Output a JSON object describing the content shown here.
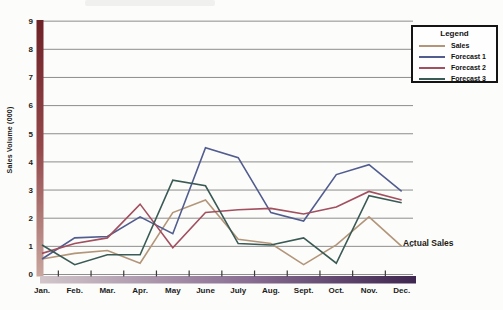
{
  "legend": {
    "title": "Legend"
  },
  "colors": {
    "gridline": "#8d8d8d",
    "tick": "#3a3a3a",
    "y_axis_bar_top": "#6e2226",
    "y_axis_bar_mid": "#94484a",
    "y_axis_bar_bottom": "#c8a69e",
    "x_axis_bar_left": "#d2c6ca",
    "x_axis_bar_mid": "#8a6e93",
    "x_axis_bar_right": "#3e2650"
  },
  "chart_data": {
    "type": "line",
    "title": "",
    "xlabel": "",
    "ylabel": "Sales Volume (000)",
    "ylim": [
      0,
      9
    ],
    "y_ticks": [
      0,
      1,
      2,
      3,
      4,
      5,
      6,
      7,
      8,
      9
    ],
    "grid": "horizontal",
    "legend_position": "top-right",
    "x": [
      "Jan.",
      "Feb.",
      "Mar.",
      "Apr.",
      "May",
      "June",
      "July",
      "Aug.",
      "Sept.",
      "Oct.",
      "Nov.",
      "Dec."
    ],
    "series": [
      {
        "name": "Sales",
        "color": "#b3967a",
        "values": [
          0.55,
          0.75,
          0.85,
          0.4,
          2.2,
          2.65,
          1.25,
          1.1,
          0.35,
          1.05,
          2.05,
          1.0
        ]
      },
      {
        "name": "Forecast 1",
        "color": "#515c8f",
        "values": [
          0.55,
          1.3,
          1.35,
          2.05,
          1.45,
          4.5,
          4.15,
          2.2,
          1.9,
          3.55,
          3.9,
          2.95
        ]
      },
      {
        "name": "Forecast 2",
        "color": "#a24f5f",
        "values": [
          0.75,
          1.1,
          1.3,
          2.5,
          0.95,
          2.2,
          2.3,
          2.35,
          2.15,
          2.4,
          2.95,
          2.65
        ]
      },
      {
        "name": "Forecast 3",
        "color": "#3a5a55",
        "values": [
          1.05,
          0.35,
          0.7,
          0.7,
          3.35,
          3.15,
          1.1,
          1.05,
          1.3,
          0.4,
          2.8,
          2.55
        ]
      }
    ],
    "annotations": [
      {
        "text": "Actual Sales",
        "x": "Dec.",
        "y": 1.0,
        "series": "Sales"
      }
    ]
  }
}
